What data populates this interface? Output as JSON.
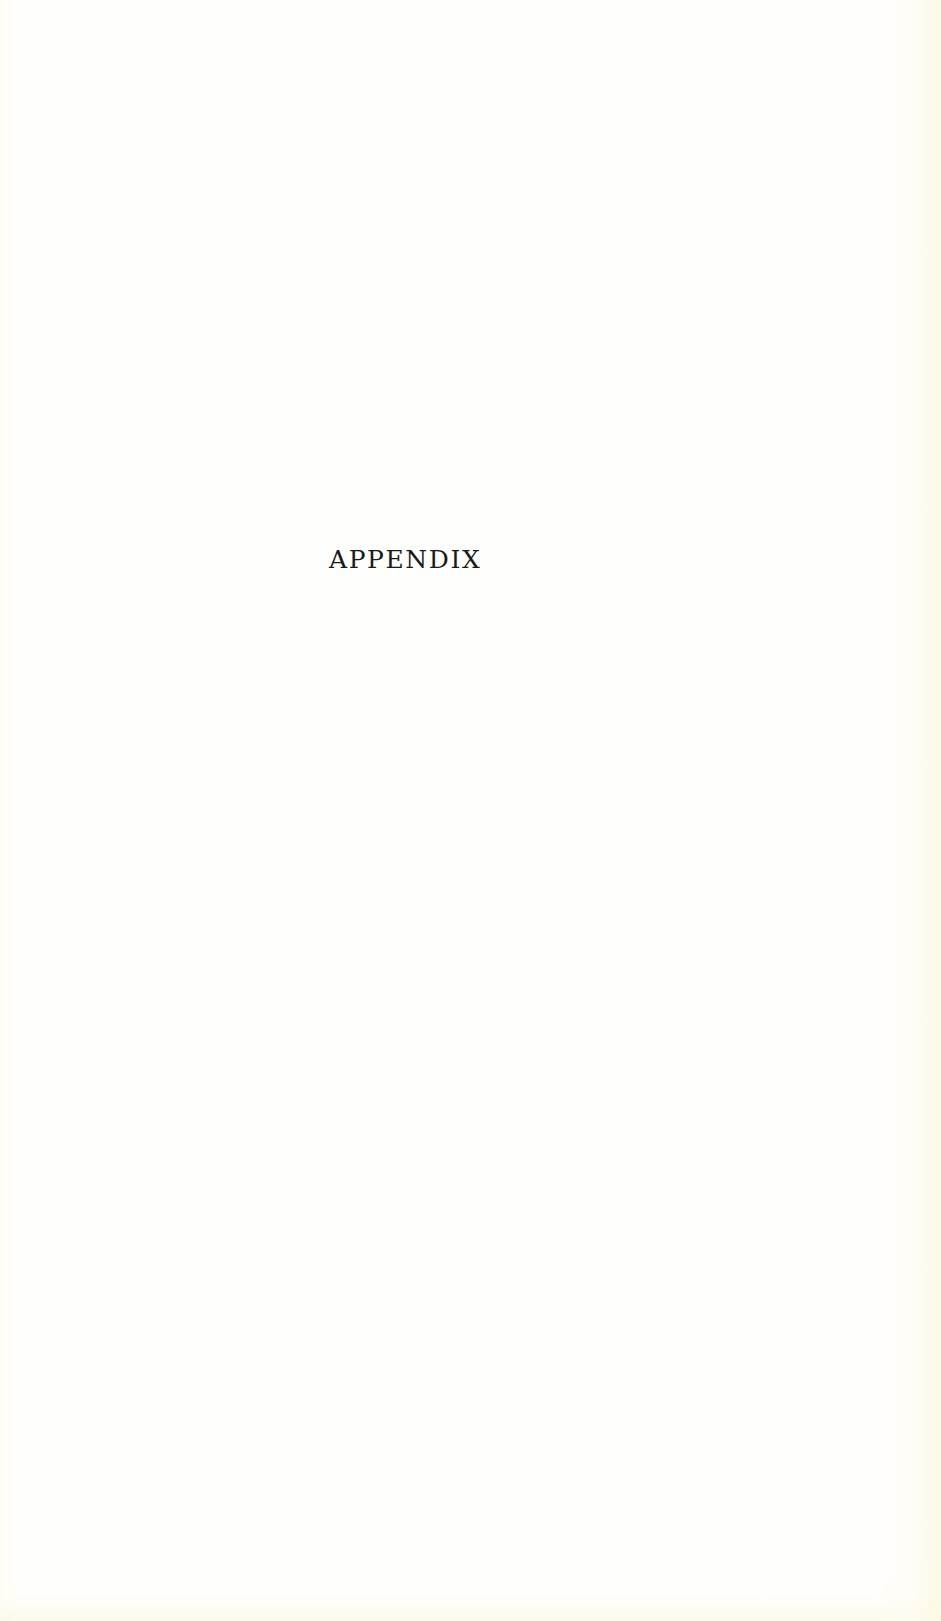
{
  "page": {
    "heading": "APPENDIX"
  },
  "colors": {
    "paper": "#fefefd",
    "edge_tint": "#fdf8e4",
    "text": "#1a1a1a"
  }
}
